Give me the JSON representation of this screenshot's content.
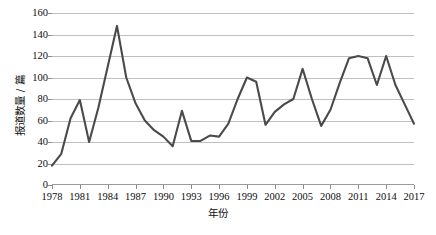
{
  "chart_data": {
    "type": "line",
    "title": "",
    "xlabel": "年份",
    "ylabel": "报道数量 / 篇",
    "ylim": [
      0,
      160
    ],
    "xlim": [
      1978,
      2017
    ],
    "grid": true,
    "legend": "none",
    "series_color": "#4a4a4a",
    "ytick_labels": [
      "160",
      "140",
      "120",
      "100",
      "80",
      "60",
      "40",
      "20",
      "0"
    ],
    "ytick_values": [
      160,
      140,
      120,
      100,
      80,
      60,
      40,
      20,
      0
    ],
    "xtick_labels": [
      "1978",
      "1981",
      "1984",
      "1987",
      "1990",
      "1993",
      "1996",
      "1999",
      "2002",
      "2005",
      "2008",
      "2011",
      "2014",
      "2017"
    ],
    "xtick_values": [
      1978,
      1981,
      1984,
      1987,
      1990,
      1993,
      1996,
      1999,
      2002,
      2005,
      2008,
      2011,
      2014,
      2017
    ],
    "x": [
      1978,
      1979,
      1980,
      1981,
      1982,
      1983,
      1984,
      1985,
      1986,
      1987,
      1988,
      1989,
      1990,
      1991,
      1992,
      1993,
      1994,
      1995,
      1996,
      1997,
      1998,
      1999,
      2000,
      2001,
      2002,
      2003,
      2004,
      2005,
      2006,
      2007,
      2008,
      2009,
      2010,
      2011,
      2012,
      2013,
      2014,
      2015,
      2016,
      2017
    ],
    "values": [
      18,
      29,
      62,
      79,
      40,
      72,
      110,
      148,
      100,
      76,
      60,
      51,
      45,
      36,
      69,
      41,
      41,
      46,
      45,
      57,
      80,
      100,
      96,
      56,
      68,
      75,
      80,
      108,
      80,
      55,
      70,
      95,
      118,
      120,
      118,
      93,
      120,
      93,
      75,
      57
    ],
    "series": [
      {
        "name": "报道数量",
        "values": [
          18,
          29,
          62,
          79,
          40,
          72,
          110,
          148,
          100,
          76,
          60,
          51,
          45,
          36,
          69,
          41,
          41,
          46,
          45,
          57,
          80,
          100,
          96,
          56,
          68,
          75,
          80,
          108,
          80,
          55,
          70,
          95,
          118,
          120,
          118,
          93,
          120,
          93,
          75,
          57
        ]
      }
    ]
  }
}
